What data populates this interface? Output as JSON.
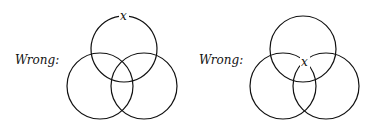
{
  "diagrams": [
    {
      "label": "Wrong:",
      "marker": "x",
      "marker_position": "on top edge of upper circle",
      "circles": [
        {
          "cx": 124,
          "cy": 49,
          "r": 33
        },
        {
          "cx": 100,
          "cy": 86,
          "r": 33
        },
        {
          "cx": 144,
          "cy": 86,
          "r": 33
        }
      ],
      "marker_xy": [
        124,
        20
      ]
    },
    {
      "label": "Wrong:",
      "marker": "x",
      "marker_position": "at boundary intersection near center",
      "circles": [
        {
          "cx": 303,
          "cy": 49,
          "r": 33
        },
        {
          "cx": 283,
          "cy": 86,
          "r": 33
        },
        {
          "cx": 326,
          "cy": 86,
          "r": 33
        }
      ],
      "marker_xy": [
        305,
        65
      ]
    }
  ],
  "colors": {
    "stroke": "#111111",
    "background": "#ffffff"
  }
}
